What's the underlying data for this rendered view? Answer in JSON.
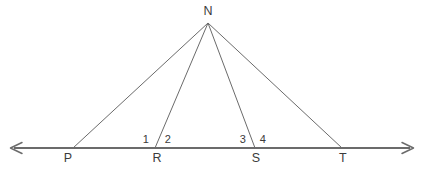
{
  "figure": {
    "type": "geometry-diagram",
    "background_color": "#ffffff",
    "line_color": "#6b6b6b",
    "text_color": "#3b3b3b",
    "baseline_color": "#6b6b6b"
  },
  "apex": {
    "name": "N",
    "label": "N",
    "x": 208,
    "y": 23,
    "label_x": 208,
    "label_y": 11
  },
  "baseline": {
    "name": "horizontal-line",
    "y": 148,
    "x_start": 10,
    "x_end": 414,
    "left_arrow": true,
    "right_arrow": true
  },
  "points": [
    {
      "label": "P",
      "x": 73,
      "y": 148,
      "label_x": 68,
      "label_y": 158
    },
    {
      "label": "R",
      "x": 155,
      "y": 148,
      "label_x": 157,
      "label_y": 158
    },
    {
      "label": "S",
      "x": 255,
      "y": 148,
      "label_x": 256,
      "label_y": 158
    },
    {
      "label": "T",
      "x": 342,
      "y": 148,
      "label_x": 343,
      "label_y": 158
    }
  ],
  "segments": [
    {
      "name": "segment-NP",
      "from": "N",
      "to": "P",
      "x1": 208,
      "y1": 23,
      "x2": 73,
      "y2": 148
    },
    {
      "name": "segment-NR",
      "from": "N",
      "to": "R",
      "x1": 208,
      "y1": 23,
      "x2": 155,
      "y2": 148
    },
    {
      "name": "segment-NS",
      "from": "N",
      "to": "S",
      "x1": 208,
      "y1": 23,
      "x2": 255,
      "y2": 148
    },
    {
      "name": "segment-NT",
      "from": "N",
      "to": "T",
      "x1": 208,
      "y1": 23,
      "x2": 342,
      "y2": 148
    }
  ],
  "angles": [
    {
      "label": "1",
      "at": "R",
      "x": 146,
      "y": 139
    },
    {
      "label": "2",
      "at": "R",
      "x": 168,
      "y": 139
    },
    {
      "label": "3",
      "at": "S",
      "x": 243,
      "y": 139
    },
    {
      "label": "4",
      "at": "S",
      "x": 263,
      "y": 139
    }
  ]
}
